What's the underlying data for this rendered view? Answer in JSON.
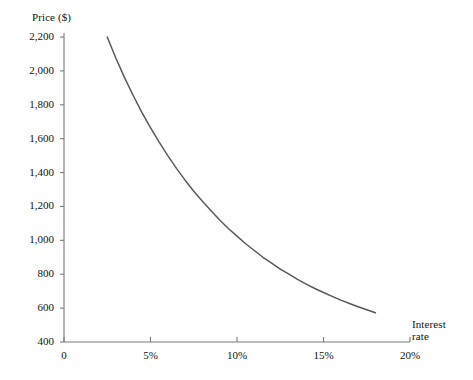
{
  "chart_data": {
    "type": "line",
    "title": "",
    "subtitle": "",
    "xlabel": "Interest rate",
    "ylabel": "Price ($)",
    "xlim": [
      0,
      20
    ],
    "ylim": [
      400,
      2200
    ],
    "grid": false,
    "legend": null,
    "x_tick_labels": [
      "0",
      "5%",
      "10%",
      "15%",
      "20%"
    ],
    "x_tick_values": [
      0,
      5,
      10,
      15,
      20
    ],
    "y_tick_labels": [
      "400",
      "600",
      "800",
      "1,000",
      "1,200",
      "1,400",
      "1,600",
      "1,800",
      "2,000",
      "2,200"
    ],
    "y_tick_values": [
      400,
      600,
      800,
      1000,
      1200,
      1400,
      1600,
      1800,
      2000,
      2200
    ],
    "series": [
      {
        "name": "Bond price",
        "color": "#595959",
        "x": [
          2.5,
          3.0,
          3.5,
          4.0,
          4.5,
          5.0,
          5.5,
          6.0,
          6.5,
          7.0,
          7.5,
          8.0,
          8.5,
          9.0,
          9.5,
          10.0,
          10.5,
          11.0,
          11.5,
          12.0,
          12.5,
          13.0,
          13.5,
          14.0,
          14.5,
          15.0,
          15.5,
          16.0,
          16.5,
          17.0,
          17.5,
          18.0
        ],
        "values": [
          2200,
          2075,
          1960,
          1855,
          1755,
          1665,
          1580,
          1500,
          1425,
          1355,
          1290,
          1230,
          1175,
          1120,
          1070,
          1025,
          980,
          940,
          900,
          865,
          830,
          800,
          770,
          742,
          716,
          692,
          669,
          647,
          627,
          608,
          590,
          573
        ]
      }
    ],
    "annotations": []
  },
  "axes": {
    "y_title": "Price ($)",
    "x_title_line1": "Interest",
    "x_title_line2": "rate"
  },
  "colors": {
    "curve": "#595959",
    "axis": "#7a7a7a",
    "text": "#111111",
    "background": "#ffffff"
  }
}
